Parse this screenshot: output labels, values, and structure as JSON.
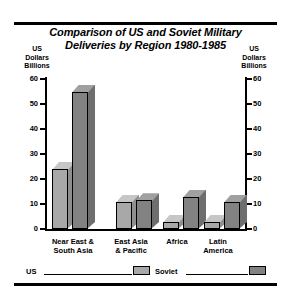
{
  "chart_data": {
    "type": "bar",
    "title": "Comparison of US and Soviet Military Deliveries by Region 1980-1985",
    "title_line1": "Comparison of US and Soviet Military",
    "title_line2": "Deliveries by Region 1980-1985",
    "categories": [
      "Near East & South Asia",
      "East Asia & Pacific",
      "Africa",
      "Latin America"
    ],
    "category_lines": [
      [
        "Near East &",
        "South Asia"
      ],
      [
        "East Asia",
        "& Pacific"
      ],
      [
        "Africa",
        ""
      ],
      [
        "Latin",
        "America"
      ]
    ],
    "series": [
      {
        "name": "US",
        "values": [
          24,
          11,
          3,
          3
        ],
        "color": "#a8a8a8"
      },
      {
        "name": "Soviet",
        "values": [
          55,
          11.5,
          13,
          11
        ],
        "color": "#828282"
      }
    ],
    "ylabel": "US Dollars Billions",
    "ylabel_lines": [
      "US",
      "Dollars",
      "Billions"
    ],
    "ylabel_right_lines": [
      "US",
      "Dollars",
      "Billions"
    ],
    "xlabel": "",
    "ylim": [
      0,
      60
    ],
    "yticks": [
      0,
      10,
      20,
      30,
      40,
      50,
      60
    ],
    "ytick_labels": [
      "0",
      "10",
      "20",
      "30",
      "40",
      "50",
      "60"
    ],
    "dual_axis": true,
    "grid": false,
    "legend_position": "bottom",
    "legend": [
      {
        "label": "US",
        "color": "#a8a8a8"
      },
      {
        "label": "Soviet",
        "color": "#828282"
      }
    ]
  },
  "colors": {
    "us_front": "#a8a8a8",
    "us_top": "#c6c6c6",
    "us_side": "#8f8f8f",
    "soviet_front": "#828282",
    "soviet_top": "#a0a0a0",
    "soviet_side": "#6e6e6e",
    "axis": "#000000",
    "background": "#ffffff"
  }
}
